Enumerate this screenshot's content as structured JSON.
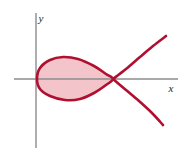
{
  "figure": {
    "background_color": "#ffffff",
    "width": 192,
    "height": 157
  },
  "axes": {
    "x_axis": {
      "label": "x",
      "label_position": {
        "x": 171,
        "y": 92
      },
      "color": "#8c8c8c",
      "stroke_width": 1.4,
      "y_pixel": 79,
      "x_start": 14,
      "x_end": 178,
      "ticks": [],
      "tick_labels": []
    },
    "y_axis": {
      "label": "y",
      "label_position": {
        "x": 41,
        "y": 22
      },
      "color": "#8c8c8c",
      "stroke_width": 1.4,
      "x_pixel": 36,
      "y_start": 13,
      "y_end": 148,
      "ticks": [],
      "tick_labels": []
    },
    "origin": {
      "x": 36,
      "y": 79
    },
    "grid": false,
    "legend": null
  },
  "chart_data": {
    "type": "line",
    "xlabel": "x",
    "ylabel": "y",
    "grid": false,
    "legend": null,
    "axis_color": "#8c8c8c",
    "curve_color": "#b01030",
    "fill_color": "#f3c5cb",
    "curve_stroke_width": 2.6,
    "features": {
      "node_point": {
        "x": 113,
        "y": 79
      },
      "loop_left_vertex": {
        "x": 37,
        "y": 79
      },
      "loop_top": {
        "x": 70,
        "y": 57
      },
      "loop_bottom": {
        "x": 68,
        "y": 100
      },
      "upper_branch_end": {
        "x": 166,
        "y": 36
      },
      "lower_branch_end": {
        "x": 163,
        "y": 125
      },
      "shaded_region": "interior of loop"
    },
    "series": [
      {
        "name": "loop-upper-arc",
        "points": [
          {
            "x": 37,
            "y": 79
          },
          {
            "x": 40,
            "y": 68
          },
          {
            "x": 50,
            "y": 60
          },
          {
            "x": 63,
            "y": 57
          },
          {
            "x": 78,
            "y": 59
          },
          {
            "x": 94,
            "y": 66
          },
          {
            "x": 106,
            "y": 74
          },
          {
            "x": 113,
            "y": 79
          }
        ]
      },
      {
        "name": "loop-lower-arc",
        "points": [
          {
            "x": 113,
            "y": 79
          },
          {
            "x": 106,
            "y": 85
          },
          {
            "x": 94,
            "y": 93
          },
          {
            "x": 80,
            "y": 99
          },
          {
            "x": 65,
            "y": 100
          },
          {
            "x": 50,
            "y": 96
          },
          {
            "x": 40,
            "y": 89
          },
          {
            "x": 37,
            "y": 79
          }
        ]
      },
      {
        "name": "upper-right-branch",
        "points": [
          {
            "x": 113,
            "y": 79
          },
          {
            "x": 126,
            "y": 69
          },
          {
            "x": 140,
            "y": 57
          },
          {
            "x": 153,
            "y": 46
          },
          {
            "x": 166,
            "y": 36
          }
        ]
      },
      {
        "name": "lower-right-branch",
        "points": [
          {
            "x": 113,
            "y": 79
          },
          {
            "x": 126,
            "y": 90
          },
          {
            "x": 139,
            "y": 101
          },
          {
            "x": 152,
            "y": 113
          },
          {
            "x": 163,
            "y": 125
          }
        ]
      }
    ]
  }
}
